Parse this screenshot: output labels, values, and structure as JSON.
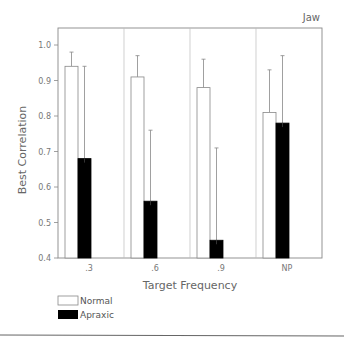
{
  "chart_data": {
    "type": "bar",
    "title": "",
    "panel_label": "Jaw",
    "xlabel": "Target Frequency",
    "ylabel": "Best Correlation",
    "categories": [
      ".3",
      ".6",
      ".9",
      "NP"
    ],
    "ylim": [
      0.4,
      1.0
    ],
    "yticks": [
      "0.4",
      "0.5",
      "0.6",
      "0.7",
      "0.8",
      "0.9",
      "1.0"
    ],
    "grid": false,
    "legend_position": "bottom-left",
    "series": [
      {
        "name": "Normal",
        "color": "#ffffff",
        "values": [
          0.94,
          0.91,
          0.88,
          0.81
        ],
        "error_upper": [
          0.98,
          0.97,
          0.96,
          0.93
        ]
      },
      {
        "name": "Apraxic",
        "color": "#000000",
        "values": [
          0.68,
          0.56,
          0.45,
          0.78
        ],
        "error_upper": [
          0.94,
          0.76,
          0.71,
          0.97
        ]
      }
    ]
  },
  "legend": {
    "items": [
      {
        "label": "Normal"
      },
      {
        "label": "Apraxic"
      }
    ]
  }
}
